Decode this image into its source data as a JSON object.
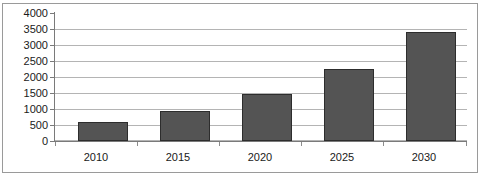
{
  "chart_data": {
    "type": "bar",
    "title": "",
    "subtitle": "",
    "xlabel": "",
    "ylabel": "",
    "categories": [
      "2010",
      "2015",
      "2020",
      "2025",
      "2030"
    ],
    "values": [
      580,
      950,
      1480,
      2250,
      3420
    ],
    "series": [
      {
        "name": "",
        "values": [
          580,
          950,
          1480,
          2250,
          3420
        ]
      }
    ],
    "ylim": [
      0,
      4000
    ],
    "ytick_labels": [
      "0",
      "500",
      "1000",
      "1500",
      "2000",
      "2500",
      "3000",
      "3500",
      "4000"
    ],
    "ytick_values": [
      0,
      500,
      1000,
      1500,
      2000,
      2500,
      3000,
      3500,
      4000
    ],
    "grid": true,
    "grid_axis": "y",
    "legend": false,
    "legend_position": "none",
    "annotations": [],
    "bar_color": "#545454",
    "bar_border_color": "#2d2d2d",
    "gridline_color": "#b4b4b4",
    "axis_color": "#7a7a7a",
    "border_color": "#9a9a9a",
    "background_color": "#ffffff",
    "text_color": "#1a1a1a"
  }
}
